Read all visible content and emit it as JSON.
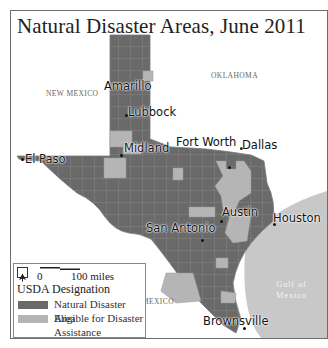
{
  "title": "Natural Disaster Areas, June 2011",
  "colors": {
    "natural_disaster_area": "#6a6a6a",
    "eligible_area": "#b5b5b5",
    "county_lines": "#9a9a9a",
    "gulf": "#c8c8c8",
    "land_outside": "#ffffff"
  },
  "regions": {
    "new_mexico": "NEW MEXICO",
    "oklahoma": "OKLAHOMA",
    "mexico": "MEXICO",
    "gulf_line1": "Gulf of",
    "gulf_line2": "Mexico"
  },
  "cities": [
    {
      "name": "Amarillo"
    },
    {
      "name": "Lubbock"
    },
    {
      "name": "Fort Worth"
    },
    {
      "name": "Dallas"
    },
    {
      "name": "Midland"
    },
    {
      "name": "El Paso"
    },
    {
      "name": "Austin"
    },
    {
      "name": "Houston"
    },
    {
      "name": "San Antonio"
    },
    {
      "name": "Brownsville"
    }
  ],
  "legend": {
    "north_icon": "north-arrow-icon",
    "scale_start": "0",
    "scale_end": "100 miles",
    "title": "USDA Designation",
    "items": [
      {
        "label": "Natural Disaster Area",
        "color": "#6a6a6a"
      },
      {
        "label": "Eligible for Disaster",
        "label2": "Assistance",
        "color": "#b5b5b5"
      }
    ]
  }
}
